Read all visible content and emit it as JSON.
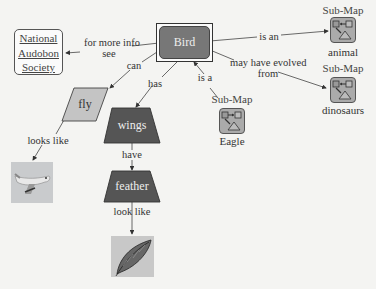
{
  "diagram": {
    "type": "concept-map",
    "nodes": {
      "bird": {
        "label": "Bird",
        "shape": "rounded-rect-double",
        "fill": "#777777"
      },
      "nas": {
        "lines": [
          "National",
          "Audobon",
          "Society"
        ],
        "shape": "rounded-rect-link"
      },
      "fly": {
        "label": "fly",
        "shape": "parallelogram",
        "fill": "#c4c4c4"
      },
      "wings": {
        "label": "wings",
        "shape": "trapezoid",
        "fill": "#555555"
      },
      "feather": {
        "label": "feather",
        "shape": "trapezoid",
        "fill": "#555555"
      },
      "airplane_image": {
        "label": "airplane image"
      },
      "feather_image": {
        "label": "feather image"
      },
      "animal": {
        "title": "Sub-Map",
        "label": "animal"
      },
      "dinosaurs": {
        "title": "Sub-Map",
        "label": "dinosaurs"
      },
      "eagle": {
        "title": "Sub-Map",
        "label": "Eagle"
      }
    },
    "edges": [
      {
        "from": "bird",
        "to": "nas",
        "label_line1": "for more info",
        "label_line2": "see"
      },
      {
        "from": "bird",
        "to": "fly",
        "label": "can"
      },
      {
        "from": "bird",
        "to": "wings",
        "label": "has"
      },
      {
        "from": "bird",
        "to": "animal",
        "label": "is an"
      },
      {
        "from": "bird",
        "to": "dinosaurs",
        "label_line1": "may have evolved",
        "label_line2": "from"
      },
      {
        "from": "eagle",
        "to": "bird",
        "label": "is a"
      },
      {
        "from": "fly",
        "to": "airplane_image",
        "label": "looks like"
      },
      {
        "from": "wings",
        "to": "feather",
        "label": "have"
      },
      {
        "from": "feather",
        "to": "feather_image",
        "label": "look like"
      }
    ]
  }
}
